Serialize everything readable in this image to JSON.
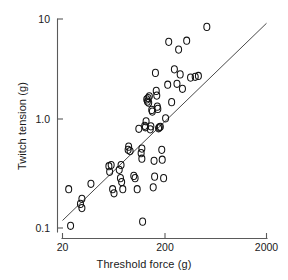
{
  "chart_data": {
    "type": "scatter",
    "title": "",
    "xlabel": "Threshold force (g)",
    "ylabel": "Twitch tension (g)",
    "xscale": "log",
    "yscale": "log",
    "xlim": [
      20,
      2000
    ],
    "ylim": [
      0.1,
      10
    ],
    "xticks": [
      20,
      200,
      2000
    ],
    "xticklabels": [
      "20",
      "200",
      "2000"
    ],
    "yticks": [
      0.1,
      1.0,
      10
    ],
    "yticklabels": [
      "0.1",
      "1.0",
      "10"
    ],
    "grid": false,
    "legend": null,
    "marker": "open-circle",
    "series": [
      {
        "name": "motor units",
        "points": [
          [
            23,
            0.235
          ],
          [
            24,
            0.105
          ],
          [
            30,
            0.17
          ],
          [
            31,
            0.19
          ],
          [
            31,
            0.155
          ],
          [
            38,
            0.265
          ],
          [
            57,
            0.39
          ],
          [
            58,
            0.345
          ],
          [
            60,
            0.4
          ],
          [
            62,
            0.235
          ],
          [
            64,
            0.215
          ],
          [
            72,
            0.36
          ],
          [
            74,
            0.3
          ],
          [
            75,
            0.4
          ],
          [
            76,
            0.275
          ],
          [
            78,
            0.235
          ],
          [
            88,
            0.56
          ],
          [
            89,
            0.6
          ],
          [
            92,
            0.545
          ],
          [
            100,
            0.315
          ],
          [
            103,
            0.3
          ],
          [
            108,
            0.235
          ],
          [
            112,
            0.89
          ],
          [
            118,
            0.52
          ],
          [
            120,
            0.575
          ],
          [
            120,
            0.46
          ],
          [
            122,
            0.115
          ],
          [
            128,
            0.95
          ],
          [
            130,
            0.92
          ],
          [
            132,
            1.05
          ],
          [
            134,
            1.7
          ],
          [
            136,
            1.62
          ],
          [
            138,
            1.75
          ],
          [
            140,
            1.58
          ],
          [
            142,
            1.82
          ],
          [
            145,
            0.88
          ],
          [
            147,
            0.94
          ],
          [
            150,
            1.35
          ],
          [
            152,
            1.3
          ],
          [
            155,
            0.245
          ],
          [
            158,
            0.44
          ],
          [
            160,
            0.31
          ],
          [
            163,
            3.05
          ],
          [
            166,
            2.05
          ],
          [
            168,
            1.85
          ],
          [
            170,
            1.45
          ],
          [
            172,
            1.38
          ],
          [
            175,
            0.9
          ],
          [
            178,
            0.92
          ],
          [
            182,
            0.93
          ],
          [
            188,
            0.56
          ],
          [
            190,
            0.45
          ],
          [
            196,
            0.3
          ],
          [
            205,
            1.12
          ],
          [
            215,
            2.35
          ],
          [
            220,
            6.05
          ],
          [
            235,
            1.6
          ],
          [
            250,
            3.3
          ],
          [
            265,
            2.4
          ],
          [
            275,
            5.1
          ],
          [
            285,
            2.95
          ],
          [
            300,
            2.15
          ],
          [
            330,
            6.2
          ],
          [
            360,
            2.75
          ],
          [
            400,
            2.8
          ],
          [
            430,
            2.85
          ],
          [
            520,
            8.4
          ]
        ]
      }
    ],
    "fit_line": {
      "label": "regression line",
      "x_start": 20,
      "y_start": 0.118,
      "x_end": 2000,
      "y_end": 9.1
    }
  },
  "axes": {
    "x_axis_name": "threshold-force-axis",
    "y_axis_name": "twitch-tension-axis"
  }
}
